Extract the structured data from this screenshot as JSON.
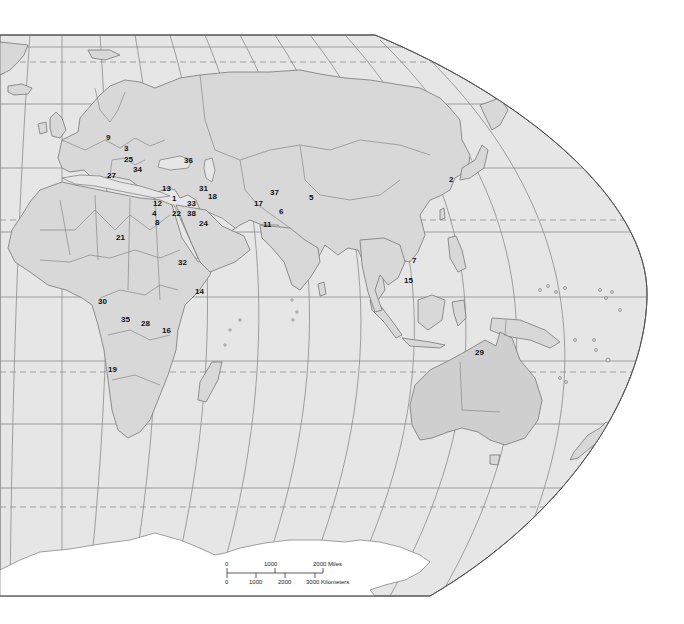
{
  "map": {
    "title": "World map – Eastern Hemisphere (Robinson-style projection)",
    "colors": {
      "ocean": "#e6e6e6",
      "land": "#d8d8d8",
      "frame": "#555555",
      "label": "#111111"
    },
    "labels": [
      {
        "id": "1",
        "text": "1",
        "region": "Israel/Lebanon"
      },
      {
        "id": "2",
        "text": "2",
        "region": "North Korea"
      },
      {
        "id": "3",
        "text": "3",
        "region": "Czech Republic/Slovakia"
      },
      {
        "id": "4",
        "text": "4",
        "region": "Egypt (Nile Delta)"
      },
      {
        "id": "5",
        "text": "5",
        "region": "Kashmir/Tibet border"
      },
      {
        "id": "6",
        "text": "6",
        "region": "Pakistan"
      },
      {
        "id": "7",
        "text": "7",
        "region": "Vietnam"
      },
      {
        "id": "8",
        "text": "8",
        "region": "Egypt"
      },
      {
        "id": "9",
        "text": "9",
        "region": "Germany"
      },
      {
        "id": "11",
        "text": "11",
        "region": "Pakistan (south)"
      },
      {
        "id": "12",
        "text": "12",
        "region": "Cyprus/Lebanon"
      },
      {
        "id": "13",
        "text": "13",
        "region": "Turkey"
      },
      {
        "id": "14",
        "text": "14",
        "region": "Somalia"
      },
      {
        "id": "15",
        "text": "15",
        "region": "Cambodia"
      },
      {
        "id": "16",
        "text": "16",
        "region": "Rwanda/Burundi"
      },
      {
        "id": "17",
        "text": "17",
        "region": "Afghanistan"
      },
      {
        "id": "18",
        "text": "18",
        "region": "Iran"
      },
      {
        "id": "19",
        "text": "19",
        "region": "Angola"
      },
      {
        "id": "21",
        "text": "21",
        "region": "Algeria/Sahara"
      },
      {
        "id": "22",
        "text": "22",
        "region": "Jordan"
      },
      {
        "id": "24",
        "text": "24",
        "region": "Persian Gulf"
      },
      {
        "id": "25",
        "text": "25",
        "region": "Balkans"
      },
      {
        "id": "27",
        "text": "27",
        "region": "Italy"
      },
      {
        "id": "28",
        "text": "28",
        "region": "DR Congo (east)"
      },
      {
        "id": "29",
        "text": "29",
        "region": "East Timor"
      },
      {
        "id": "30",
        "text": "30",
        "region": "Cameroon/Gabon"
      },
      {
        "id": "31",
        "text": "31",
        "region": "Armenia/Azerbaijan"
      },
      {
        "id": "32",
        "text": "32",
        "region": "Eritrea/Ethiopia"
      },
      {
        "id": "33",
        "text": "33",
        "region": "Iraq"
      },
      {
        "id": "34",
        "text": "34",
        "region": "Balkans (south)"
      },
      {
        "id": "35",
        "text": "35",
        "region": "Congo"
      },
      {
        "id": "36",
        "text": "36",
        "region": "Georgia/Chechnya"
      },
      {
        "id": "37",
        "text": "37",
        "region": "Tajikistan"
      },
      {
        "id": "38",
        "text": "38",
        "region": "Iraq (south)"
      }
    ],
    "scale_bar": {
      "miles_ticks": [
        "0",
        "1000",
        "2000 Miles"
      ],
      "km_ticks": [
        "0",
        "1000",
        "2000",
        "3000 Kilometers"
      ]
    }
  }
}
